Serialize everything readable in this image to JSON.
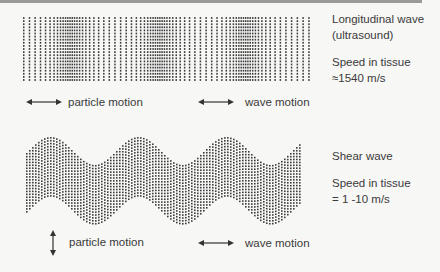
{
  "diagram": {
    "longitudinal": {
      "title_line1": "Longitudinal wave",
      "title_line2": "(ultrasound)",
      "speed_line1": "Speed in tissue",
      "speed_line2": "≈1540 m/s",
      "particle_motion_label": "particle motion",
      "wave_motion_label": "wave motion",
      "particle_arrow": "horizontal-double-arrow-icon",
      "wave_arrow": "horizontal-double-arrow-icon",
      "pattern": {
        "x_start": 23,
        "x_end": 310,
        "y_start": 18,
        "y_end": 80,
        "rows": 21,
        "columns": 70,
        "compression_centers_x": [
          68,
          157,
          243
        ]
      }
    },
    "shear": {
      "title": "Shear wave",
      "speed_line1": "Speed in tissue",
      "speed_line2": "= 1 -10 m/s",
      "particle_motion_label": "particle motion",
      "wave_motion_label": "wave motion",
      "particle_arrow": "vertical-double-arrow-icon",
      "wave_arrow": "horizontal-double-arrow-icon",
      "pattern": {
        "x_start": 26,
        "x_end": 300,
        "center_y": 180,
        "band_height": 58,
        "amplitude": 14,
        "wavelength": 88,
        "phase_x": 50
      }
    },
    "colors": {
      "dot": "#3c3c3c",
      "text": "#3a3a3a",
      "background": "#f7f7f6"
    }
  }
}
